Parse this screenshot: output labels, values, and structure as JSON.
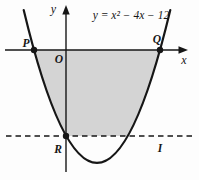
{
  "figure": {
    "equation": "y = x² − 4x − 12",
    "labels": {
      "y_axis": "y",
      "x_axis": "x",
      "origin": "O",
      "p": "P",
      "q": "Q",
      "r": "R",
      "i": "I"
    },
    "colors": {
      "background": "#fdfdfd",
      "shade": "#d4d4d4",
      "ink": "#161616"
    }
  }
}
